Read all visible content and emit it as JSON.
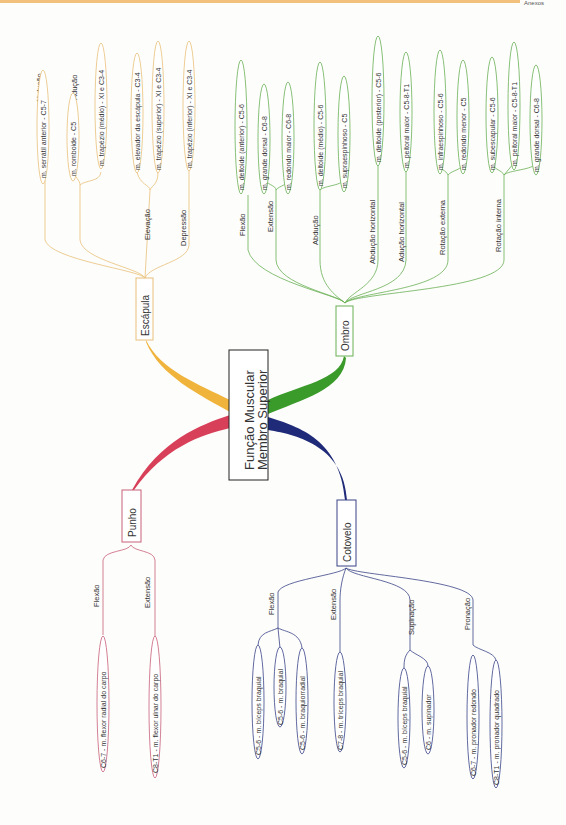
{
  "page": {
    "corner_text": "Anexos"
  },
  "center": {
    "title_line1": "Função Muscular",
    "title_line2": "Membro Superior"
  },
  "colors": {
    "escapula": "#f0b43c",
    "ombro": "#3a9a2a",
    "punho": "#d8405a",
    "cotovelo": "#1f2a78",
    "escapula_line": "#e8c07a",
    "ombro_line": "#6ab055",
    "punho_line": "#c8607a",
    "cotovelo_line": "#3a4488"
  },
  "branches": {
    "escapula": {
      "label": "Escápula",
      "groups": [
        {
          "label": "Abdução",
          "items": [
            "m. serrátil anterior - C5-7"
          ]
        },
        {
          "label": "Adução",
          "items": [
            "m. romboide - C5",
            "m. trapézio (médio) - XI e C3-4"
          ]
        },
        {
          "label": "Elevação",
          "items": [
            "m. elevador da escápula - C3-4",
            "m. trapézio (superior) - XI e C3-4"
          ]
        },
        {
          "label": "Depressão",
          "items": [
            "m. trapézio (inferior) - XI e C3-4"
          ]
        }
      ]
    },
    "ombro": {
      "label": "Ombro",
      "groups": [
        {
          "label": "Flexão",
          "items": [
            "m. deltoide (anterior) - C5-6"
          ]
        },
        {
          "label": "Extensão",
          "items": [
            "m. grande dorsal - C6-8",
            "m. redondo maior - C6-8"
          ]
        },
        {
          "label": "Abdução",
          "items": [
            "m. deltoide (médio) - C5-6",
            "m. supraespinhoso - C5"
          ]
        },
        {
          "label": "Abdução horizontal",
          "items": [
            "m. deltoide (posterior) - C5-6"
          ]
        },
        {
          "label": "Adução horizontal",
          "items": [
            "m. peitoral maior - C5-8-T1"
          ]
        },
        {
          "label": "Rotação externa",
          "items": [
            "m. infraespinhoso - C5-6",
            "m. redondo menor - C5"
          ]
        },
        {
          "label": "Rotação interna",
          "items": [
            "m. subescapular - C5-6",
            "m. peitoral maior - C5-8-T1",
            "m. grande dorsal - C6-8"
          ]
        }
      ]
    },
    "punho": {
      "label": "Punho",
      "groups": [
        {
          "label": "Flexão",
          "items": [
            "C6-7 - m. flexor radial do carpo"
          ]
        },
        {
          "label": "Extensão",
          "items": [
            "C8-T1 - m. flexor ulnar do carpo"
          ]
        }
      ]
    },
    "cotovelo": {
      "label": "Cotovelo",
      "groups": [
        {
          "label": "Flexão",
          "items": [
            "C5-6 - m. bíceps braquial",
            "C5-6 - m. braquial",
            "C5-6 - m. braquiorradial"
          ]
        },
        {
          "label": "Extensão",
          "items": [
            "C7-8 - m. tríceps braquial"
          ]
        },
        {
          "label": "Supinação",
          "items": [
            "C5-6 - m. bíceps braquial",
            "C6 - m. supinador"
          ]
        },
        {
          "label": "Pronação",
          "items": [
            "C6-7 - m. pronador redondo",
            "C8-T1 - m. pronador quadrado"
          ]
        }
      ]
    }
  }
}
